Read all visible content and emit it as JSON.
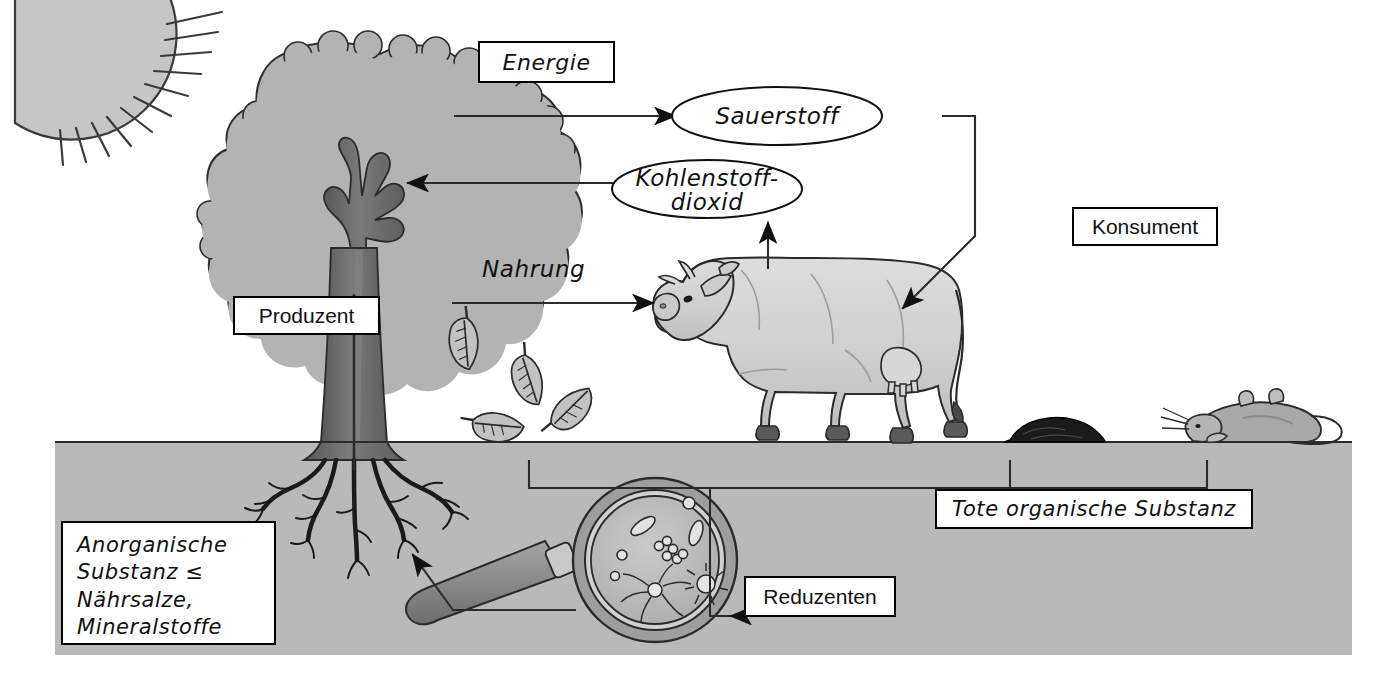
{
  "diagram": {
    "title_label": "Energie",
    "background": {
      "sky": "#ffffff",
      "soil": "#b9b9b9",
      "outline": "#000000"
    }
  },
  "boxes": {
    "energie": "Energie",
    "produzent": "Produzent",
    "konsument": "Konsument",
    "reduzenten": "Reduzenten",
    "tote_organische_substanz": "Tote organische Substanz",
    "anorganische": {
      "line1": "Anorganische",
      "line2": "Substanz ≤",
      "line3": "Nährsalze,",
      "line4": "Mineralstoffe"
    }
  },
  "ellipses": {
    "sauerstoff": "Sauerstoff",
    "kohlenstoffdioxid_line1": "Kohlenstoff-",
    "kohlenstoffdioxid_line2": "dioxid"
  },
  "arrow_labels": {
    "nahrung": "Nahrung"
  },
  "figures": {
    "sun": "sun-icon",
    "tree": "tree-producer",
    "cow": "cow-consumer",
    "mouse": "dead-mouse",
    "dung": "dung-pile",
    "leaves": "fallen-leaves",
    "magnifier": "magnifier-decomposers"
  },
  "colors": {
    "foliage": "#b3b3b3",
    "trunk": "#6f6f6f",
    "soil": "#b9b9b9",
    "cow_body": "#d4d4d4",
    "cow_shade": "#b0b0b0",
    "hoof": "#5a5a5a",
    "mouse": "#a8a8a8",
    "dung": "#1b1b1b",
    "lens_rim": "#8f8f8f",
    "lens_glass": "#bdbdbd",
    "handle": "#8a8a8a",
    "leaf": "#c2c2c2",
    "ink": "#111111"
  }
}
